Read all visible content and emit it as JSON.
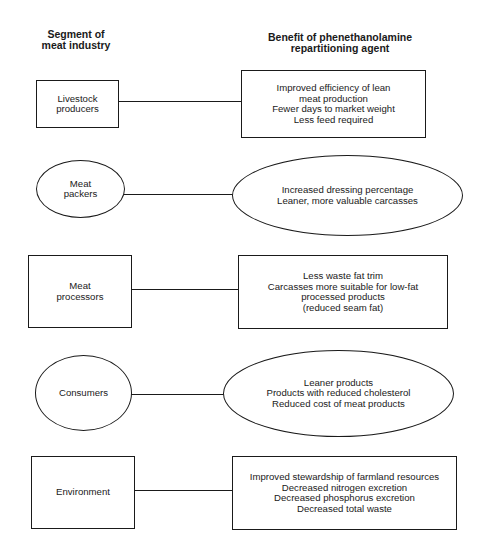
{
  "headers": {
    "segment": "Segment of\nmeat industry",
    "benefit": "Benefit of phenethanolamine\nrepartitioning agent"
  },
  "rows": [
    {
      "segment": "Livestock\nproducers",
      "segment_shape": "rectangle",
      "benefits": "Improved efficiency of lean\nmeat production\nFewer days to market weight\nLess feed required",
      "benefit_shape": "rectangle"
    },
    {
      "segment": "Meat\npackers",
      "segment_shape": "ellipse",
      "benefits": "Increased dressing percentage\nLeaner, more valuable carcasses",
      "benefit_shape": "ellipse"
    },
    {
      "segment": "Meat\nprocessors",
      "segment_shape": "rectangle",
      "benefits": "Less waste fat trim\nCarcasses more suitable for low-fat\nprocessed products\n(reduced seam fat)",
      "benefit_shape": "rectangle"
    },
    {
      "segment": "Consumers",
      "segment_shape": "ellipse",
      "benefits": "Leaner products\nProducts with reduced cholesterol\nReduced cost of meat products",
      "benefit_shape": "ellipse"
    },
    {
      "segment": "Environment",
      "segment_shape": "rectangle",
      "benefits": "Improved stewardship of farmland resources\nDecreased nitrogen excretion\nDecreased phosphorus excretion\nDecreased total waste",
      "benefit_shape": "rectangle"
    }
  ]
}
